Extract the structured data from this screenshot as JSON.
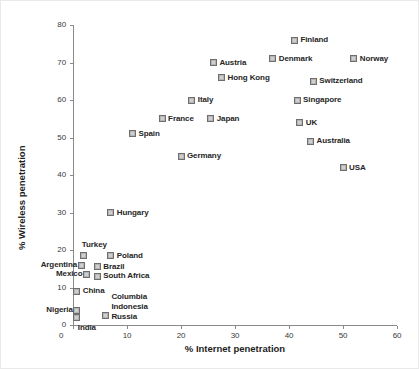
{
  "chart_data": {
    "type": "scatter",
    "title": "",
    "xlabel": "% Internet penetration",
    "ylabel": "% Wireless penetration",
    "xlim": [
      0,
      60
    ],
    "ylim": [
      0,
      80
    ],
    "xticks": [
      0,
      10,
      20,
      30,
      40,
      50,
      60
    ],
    "yticks": [
      0,
      10,
      20,
      30,
      40,
      50,
      60,
      70,
      80
    ],
    "grid": false,
    "legend": "none",
    "marker_color": "#b4b4b4",
    "marker_edge_color": "#6e6e6e",
    "points": [
      {
        "label": "Finland",
        "x": 41.0,
        "y": 76.0,
        "label_side": "right"
      },
      {
        "label": "Norway",
        "x": 52.0,
        "y": 71.0,
        "label_side": "right"
      },
      {
        "label": "Denmark",
        "x": 37.0,
        "y": 71.0,
        "label_side": "right"
      },
      {
        "label": "Austria",
        "x": 26.0,
        "y": 70.0,
        "label_side": "right"
      },
      {
        "label": "Hong Kong",
        "x": 27.5,
        "y": 66.0,
        "label_side": "right"
      },
      {
        "label": "Switzerland",
        "x": 44.5,
        "y": 65.0,
        "label_side": "right"
      },
      {
        "label": "Italy",
        "x": 22.0,
        "y": 60.0,
        "label_side": "right"
      },
      {
        "label": "Singapore",
        "x": 41.5,
        "y": 60.0,
        "label_side": "right"
      },
      {
        "label": "France",
        "x": 16.5,
        "y": 55.0,
        "label_side": "right"
      },
      {
        "label": "Japan",
        "x": 25.5,
        "y": 55.0,
        "label_side": "right"
      },
      {
        "label": "UK",
        "x": 42.0,
        "y": 54.0,
        "label_side": "right"
      },
      {
        "label": "Spain",
        "x": 11.0,
        "y": 51.0,
        "label_side": "right"
      },
      {
        "label": "Australia",
        "x": 44.0,
        "y": 49.0,
        "label_side": "right"
      },
      {
        "label": "Germany",
        "x": 20.0,
        "y": 45.0,
        "label_side": "right"
      },
      {
        "label": "USA",
        "x": 50.0,
        "y": 42.0,
        "label_side": "right"
      },
      {
        "label": "Hungary",
        "x": 7.0,
        "y": 30.0,
        "label_side": "right"
      },
      {
        "label": "Turkey",
        "x": 2.0,
        "y": 18.5,
        "label_side": "above"
      },
      {
        "label": "Poland",
        "x": 7.0,
        "y": 18.5,
        "label_side": "right"
      },
      {
        "label": "Argentina",
        "x": 1.5,
        "y": 16.0,
        "label_side": "left"
      },
      {
        "label": "Brazil",
        "x": 4.5,
        "y": 15.5,
        "label_side": "right"
      },
      {
        "label": "Mexico",
        "x": 2.5,
        "y": 13.5,
        "label_side": "left"
      },
      {
        "label": "South Africa",
        "x": 4.5,
        "y": 13.0,
        "label_side": "right"
      },
      {
        "label": "China",
        "x": 0.7,
        "y": 9.0,
        "label_side": "right"
      },
      {
        "label": "Nigeria",
        "x": 0.7,
        "y": 4.0,
        "label_side": "left"
      },
      {
        "label": "India",
        "x": 0.7,
        "y": 2.0,
        "label_side": "below"
      },
      {
        "label": "Columbia Indonesia Russia",
        "x": 6.0,
        "y": 2.5,
        "label_side": "stack"
      }
    ],
    "stacked_labels": [
      "Columbia",
      "Indonesia",
      "Russia"
    ]
  }
}
